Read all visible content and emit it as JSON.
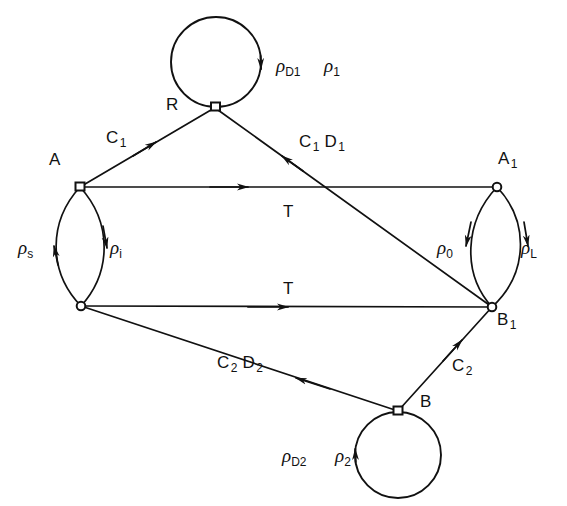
{
  "figure": {
    "type": "state-transition-diagram",
    "background": "#ffffff",
    "stroke_color": "#111111",
    "width": 567,
    "height": 506
  },
  "nodes": [
    {
      "id": "R",
      "label": "R",
      "x": 216,
      "y": 107,
      "marker": "square-open",
      "label_x": 168,
      "label_y": 96
    },
    {
      "id": "A",
      "label": "A",
      "x": 80,
      "y": 187,
      "marker": "square-open",
      "label_x": 50,
      "label_y": 155
    },
    {
      "id": "A1",
      "label": "A",
      "sub": "1",
      "x": 497,
      "y": 187,
      "marker": "circle-open",
      "label_x": 498,
      "label_y": 152
    },
    {
      "id": "AL",
      "label": "",
      "x": 81,
      "y": 306,
      "marker": "circle-open",
      "label_x": 0,
      "label_y": 0
    },
    {
      "id": "B1",
      "label": "B",
      "sub": "1",
      "x": 492,
      "y": 307,
      "marker": "circle-open",
      "label_x": 498,
      "label_y": 312
    },
    {
      "id": "B",
      "label": "B",
      "x": 398,
      "y": 411,
      "marker": "square-open",
      "label_x": 418,
      "label_y": 396
    }
  ],
  "edge_labels": {
    "c1": "C",
    "c1_sub": "1",
    "c1_d1_first": "C",
    "c1_d1_first_sub": "1",
    "c1_d1_second": "D",
    "c1_d1_second_sub": "1",
    "t_upper": "T",
    "t_lower": "T",
    "c2_d2_first": "C",
    "c2_d2_first_sub": "2",
    "c2_d2_second": "D",
    "c2_d2_second_sub": "2",
    "c2": "C",
    "c2_sub": "2"
  },
  "rho_labels": {
    "rho_d1": {
      "glyph": "ρ",
      "sub": "D1",
      "x": 276,
      "y": 56
    },
    "rho_1": {
      "glyph": "ρ",
      "sub": "1",
      "x": 323,
      "y": 56
    },
    "rho_s": {
      "glyph": "ρ",
      "sub": "s",
      "x": 18,
      "y": 238
    },
    "rho_i": {
      "glyph": "ρ",
      "sub": "i",
      "x": 110,
      "y": 238
    },
    "rho_0": {
      "glyph": "ρ",
      "sub": "0",
      "x": 437,
      "y": 238
    },
    "rho_l": {
      "glyph": "ρ",
      "sub": "L",
      "x": 520,
      "y": 238
    },
    "rho_d2": {
      "glyph": "ρ",
      "sub": "D2",
      "x": 282,
      "y": 446
    },
    "rho_2": {
      "glyph": "ρ",
      "sub": "2",
      "x": 334,
      "y": 446
    }
  },
  "plain_labels": {
    "c1": {
      "x": 107,
      "y": 130
    },
    "c1d1": {
      "x": 300,
      "y": 134
    },
    "t_up": {
      "x": 284,
      "y": 204
    },
    "t_lo": {
      "x": 284,
      "y": 281
    },
    "c2d2": {
      "x": 218,
      "y": 355
    },
    "c2": {
      "x": 452,
      "y": 358
    },
    "r": {
      "x": 168,
      "y": 96
    },
    "a": {
      "x": 50,
      "y": 152
    },
    "a1": {
      "x": 500,
      "y": 150
    },
    "b1": {
      "x": 498,
      "y": 310
    },
    "b": {
      "x": 420,
      "y": 394
    }
  },
  "loops": [
    {
      "id": "top-loop",
      "cx": 216,
      "cy": 62,
      "r": 45,
      "direction": "clockwise",
      "arrow_side": "right"
    },
    {
      "id": "bottom-loop",
      "cx": 398,
      "cy": 455,
      "r": 43,
      "direction": "clockwise",
      "arrow_side": "left"
    }
  ]
}
